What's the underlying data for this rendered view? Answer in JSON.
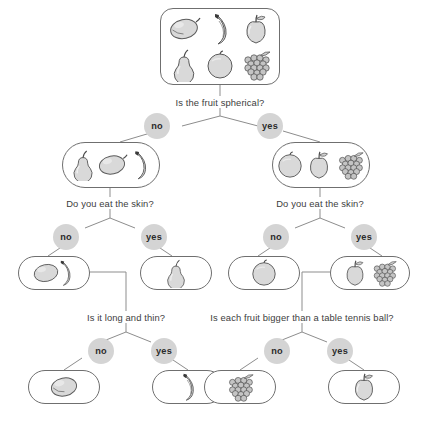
{
  "diagram": {
    "colors": {
      "box_border": "#6f6f6f",
      "connector": "#8d8d8d",
      "answer_circle": "#d4d4d4",
      "text": "#3d3d3d",
      "fruit_fill": "#d9d9d9",
      "fruit_stroke": "#5a5a5a",
      "background": "#ffffff"
    },
    "answer_labels": {
      "no": "no",
      "yes": "yes"
    },
    "questions": [
      {
        "id": "q-root",
        "text": "Is the fruit spherical?"
      },
      {
        "id": "q-skin-left",
        "text": "Do you eat the skin?"
      },
      {
        "id": "q-skin-right",
        "text": "Do you eat the skin?"
      },
      {
        "id": "q-long-thin",
        "text": "Is it long and thin?"
      },
      {
        "id": "q-bigger-ball",
        "text": "Is each fruit bigger than a table tennis ball?"
      }
    ],
    "nodes": [
      {
        "id": "root",
        "level": 0,
        "fruits": [
          "lemon",
          "banana",
          "apple",
          "pear",
          "orange",
          "grapes"
        ]
      },
      {
        "id": "not-spherical",
        "level": 1,
        "branch": "no",
        "fruits": [
          "pear",
          "lemon",
          "banana"
        ]
      },
      {
        "id": "spherical",
        "level": 1,
        "branch": "yes",
        "fruits": [
          "orange",
          "apple",
          "grapes"
        ]
      },
      {
        "id": "skin-no-left",
        "level": 2,
        "branch": "no",
        "fruits": [
          "lemon",
          "banana"
        ]
      },
      {
        "id": "skin-yes-left",
        "level": 2,
        "branch": "yes",
        "fruits": [
          "pear"
        ]
      },
      {
        "id": "skin-no-right",
        "level": 2,
        "branch": "no",
        "fruits": [
          "orange"
        ]
      },
      {
        "id": "skin-yes-right",
        "level": 2,
        "branch": "yes",
        "fruits": [
          "apple",
          "grapes"
        ]
      },
      {
        "id": "long-thin-no",
        "level": 3,
        "branch": "no",
        "fruits": [
          "lemon"
        ]
      },
      {
        "id": "long-thin-yes",
        "level": 3,
        "branch": "yes",
        "fruits": [
          "banana"
        ]
      },
      {
        "id": "bigger-no",
        "level": 3,
        "branch": "no",
        "fruits": [
          "grapes"
        ]
      },
      {
        "id": "bigger-yes",
        "level": 3,
        "branch": "yes",
        "fruits": [
          "apple"
        ]
      }
    ],
    "fruit_names": {
      "lemon": "lemon-icon",
      "banana": "banana-icon",
      "apple": "apple-icon",
      "pear": "pear-icon",
      "orange": "orange-icon",
      "grapes": "grapes-icon"
    }
  }
}
